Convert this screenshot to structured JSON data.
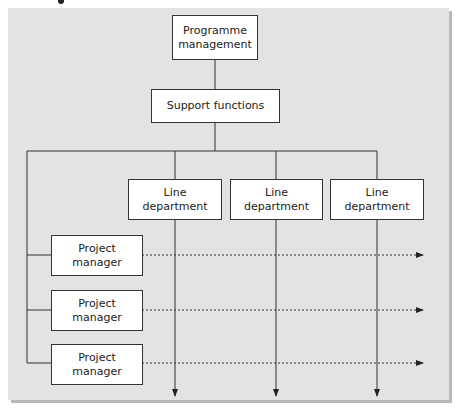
{
  "diagram": {
    "type": "matrix organisation chart",
    "nodes": {
      "programme_management": {
        "line1": "Programme",
        "line2": "management"
      },
      "support_functions": {
        "label": "Support functions"
      },
      "line_departments": [
        {
          "line1": "Line",
          "line2": "department"
        },
        {
          "line1": "Line",
          "line2": "department"
        },
        {
          "line1": "Line",
          "line2": "department"
        }
      ],
      "project_managers": [
        {
          "line1": "Project",
          "line2": "manager"
        },
        {
          "line1": "Project",
          "line2": "manager"
        },
        {
          "line1": "Project",
          "line2": "manager"
        }
      ]
    },
    "edges": [
      {
        "from": "Programme management",
        "to": "Support functions",
        "style": "solid"
      },
      {
        "from": "Support functions",
        "to": "Line departments / Project managers",
        "style": "solid"
      },
      {
        "from": "Line department",
        "to": "down",
        "style": "solid-arrow",
        "count": 3
      },
      {
        "from": "Project manager",
        "to": "right",
        "style": "dashed-arrow",
        "count": 3
      }
    ],
    "colors": {
      "panel": "#e3e3e3",
      "box": "#ffffff",
      "line": "#333333",
      "shadow": "#b9b9b9"
    }
  }
}
